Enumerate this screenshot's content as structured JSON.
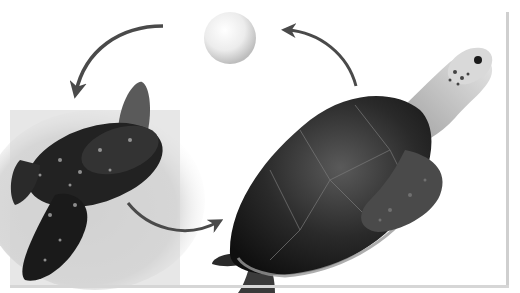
{
  "diagram": {
    "title": "",
    "type": "life-cycle",
    "stages": [
      {
        "id": "egg",
        "label": "",
        "icon": "egg-icon"
      },
      {
        "id": "hatchling",
        "label": "",
        "icon": "hatchling-turtle-icon"
      },
      {
        "id": "adult",
        "label": "",
        "icon": "adult-sea-turtle-icon"
      }
    ],
    "arrows": [
      {
        "from": "egg",
        "to": "hatchling"
      },
      {
        "from": "hatchling",
        "to": "adult"
      },
      {
        "from": "adult",
        "to": "egg"
      }
    ],
    "colors": {
      "arrow": "#4a4a4a",
      "background": "#ffffff",
      "sand": "#d8d8d8",
      "shell_dark": "#1e1e1e",
      "frame": "#cfcfcf"
    }
  }
}
